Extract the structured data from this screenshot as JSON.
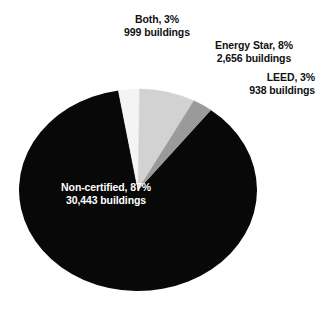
{
  "chart_data": {
    "type": "pie",
    "title": "",
    "subtitle": "",
    "xlabel": "",
    "ylabel": "",
    "legend_position": "none",
    "grid": false,
    "total_buildings": 35036,
    "units": "buildings",
    "categories": [
      "Both",
      "Energy Star",
      "LEED",
      "Non-certified"
    ],
    "values": [
      999,
      2656,
      938,
      30443
    ],
    "percentages": [
      3,
      8,
      3,
      87
    ],
    "slices": [
      {
        "name": "Both",
        "percent": 3,
        "percent_label": "3%",
        "count": 999,
        "count_label": "999",
        "label_line1": "Both, 3%",
        "label_line2": "999 buildings",
        "color": "#f4f4f4",
        "label_color": "#111111",
        "label_position": "outside-top"
      },
      {
        "name": "Energy Star",
        "percent": 8,
        "percent_label": "8%",
        "count": 2656,
        "count_label": "2,656",
        "label_line1": "Energy Star, 8%",
        "label_line2": "2,656 buildings",
        "color": "#d2d2d2",
        "label_color": "#111111",
        "label_position": "outside-top-right"
      },
      {
        "name": "LEED",
        "percent": 3,
        "percent_label": "3%",
        "count": 938,
        "count_label": "938",
        "label_line1": "LEED, 3%",
        "label_line2": "938 buildings",
        "color": "#9a9a9a",
        "label_color": "#111111",
        "label_position": "outside-right"
      },
      {
        "name": "Non-certified",
        "percent": 87,
        "percent_label": "87%",
        "count": 30443,
        "count_label": "30,443",
        "label_line1": "Non-certified, 87%",
        "label_line2": "30,443 buildings",
        "color": "#080808",
        "label_color": "#ffffff",
        "label_position": "inside-left"
      }
    ],
    "background_color": "#ffffff"
  }
}
